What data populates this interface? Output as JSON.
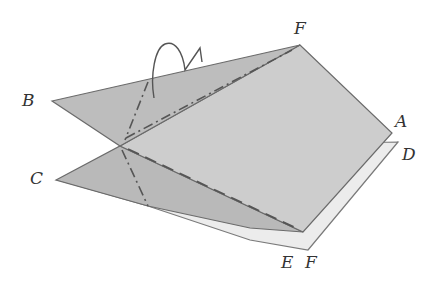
{
  "diagram": {
    "type": "origami-fold-illustration",
    "labels": {
      "F_top": "F",
      "B": "B",
      "A": "A",
      "D": "D",
      "C": "C",
      "E": "E",
      "F_bottom": "F"
    },
    "line_styles": {
      "mountain_fold": "dash-dot",
      "valley_fold": "dashed"
    },
    "symbols": [
      "fold-arrow-hook"
    ],
    "colors": {
      "paper_fill": "#c9c9c9",
      "paper_fill_light": "#d6d6d6",
      "paper_fill_dark": "#b4b4b4",
      "under_sheet": "#ececec",
      "outline": "#6b6b6b",
      "fold_line": "#555555",
      "label": "#333333"
    }
  }
}
